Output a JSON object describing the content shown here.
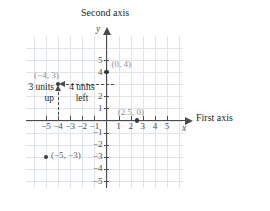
{
  "figure": {
    "type": "coordinate-plane",
    "second_axis_title": "Second axis",
    "first_axis_title": "First axis",
    "y_variable": "y",
    "x_variable": "x"
  },
  "axes": {
    "x_ticks": [
      "-5",
      "-4",
      "-3",
      "-2",
      "-1",
      "1",
      "2",
      "3",
      "4",
      "5"
    ],
    "y_ticks": [
      "5",
      "4",
      "2",
      "1",
      "-1",
      "-2",
      "-3",
      "-4",
      "-5"
    ],
    "x_range": [
      -6.5,
      6.5
    ],
    "y_range": [
      -6,
      6.5
    ],
    "grid": true
  },
  "points": [
    {
      "label": "(0, 4)",
      "x": 0,
      "y": 4
    },
    {
      "label": "(2.5, 0)",
      "x": 2.5,
      "y": 0
    },
    {
      "label": "(-4, 3)",
      "x": -4,
      "y": 3
    },
    {
      "label": "(-5, -3)",
      "x": -5,
      "y": -3
    }
  ],
  "annotations": {
    "up": "3 units\nup",
    "up_line1": "3 units",
    "up_line2": "up",
    "left": "4 units\nleft",
    "left_line1": "4 units",
    "left_line2": "left"
  },
  "chart_data": {
    "type": "scatter",
    "title": "",
    "xlabel": "First axis",
    "ylabel": "Second axis",
    "xlim": [
      -6.5,
      6.5
    ],
    "ylim": [
      -6,
      6.5
    ],
    "grid": true,
    "x": [
      0,
      2.5,
      -4,
      -5
    ],
    "y": [
      4,
      0,
      3,
      -3
    ],
    "point_labels": [
      "(0, 4)",
      "(2.5, 0)",
      "(-4, 3)",
      "(-5, -3)"
    ],
    "annotations": [
      "3 units up",
      "4 units left"
    ]
  },
  "colors": {
    "axis": "#4b4b4d",
    "grid": "#dfe3ea",
    "point": "#3a3a3c",
    "point_label": "#8d8f92",
    "text": "#231f20"
  }
}
